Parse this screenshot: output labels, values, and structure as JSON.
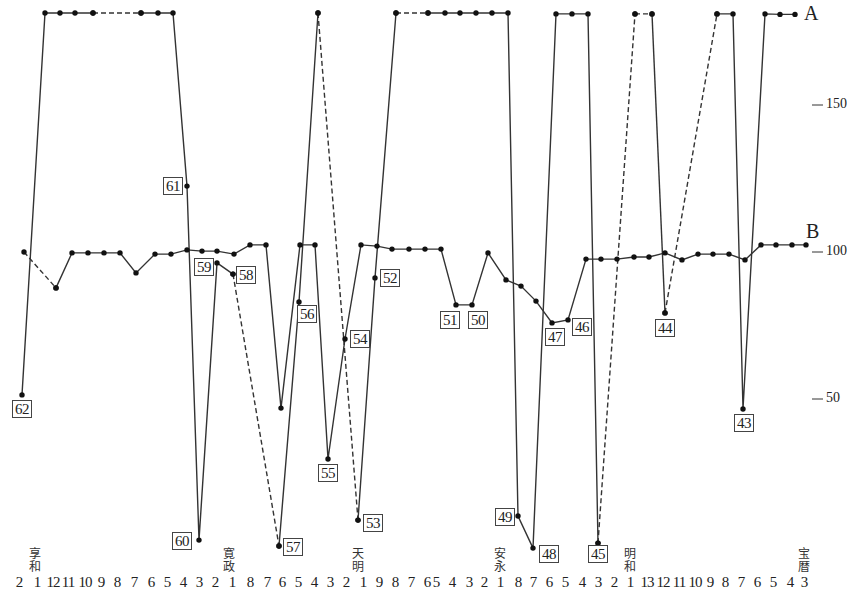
{
  "chart_data": {
    "type": "line",
    "title": "",
    "xlabel": "",
    "ylabel": "",
    "ylim": [
      0,
      185
    ],
    "y_ticks": [
      {
        "value": 150,
        "label": "150"
      },
      {
        "value": 100,
        "label": "100"
      },
      {
        "value": 50,
        "label": "50"
      }
    ],
    "grid": false,
    "legend": [
      {
        "name": "A",
        "position": "right-top"
      },
      {
        "name": "B",
        "position": "right-middle"
      }
    ],
    "x_ticks": [
      {
        "x": 19,
        "label": "2"
      },
      {
        "x": 37,
        "label": "1"
      },
      {
        "x": 53,
        "label": "12"
      },
      {
        "x": 68,
        "label": "11"
      },
      {
        "x": 85,
        "label": "10"
      },
      {
        "x": 101,
        "label": "9"
      },
      {
        "x": 117,
        "label": "8"
      },
      {
        "x": 134,
        "label": "7"
      },
      {
        "x": 151,
        "label": "6"
      },
      {
        "x": 167,
        "label": "5"
      },
      {
        "x": 183,
        "label": "4"
      },
      {
        "x": 199,
        "label": "3"
      },
      {
        "x": 215,
        "label": "2"
      },
      {
        "x": 232,
        "label": "1"
      },
      {
        "x": 250,
        "label": "8"
      },
      {
        "x": 267,
        "label": "7"
      },
      {
        "x": 282,
        "label": "6"
      },
      {
        "x": 298,
        "label": "5"
      },
      {
        "x": 314,
        "label": "4"
      },
      {
        "x": 330,
        "label": "3"
      },
      {
        "x": 346,
        "label": "2"
      },
      {
        "x": 363,
        "label": "1"
      },
      {
        "x": 379,
        "label": "9"
      },
      {
        "x": 395,
        "label": "8"
      },
      {
        "x": 411,
        "label": "7"
      },
      {
        "x": 427,
        "label": "6"
      },
      {
        "x": 436,
        "label": "5"
      },
      {
        "x": 452,
        "label": "4"
      },
      {
        "x": 469,
        "label": "3"
      },
      {
        "x": 484,
        "label": "2"
      },
      {
        "x": 500,
        "label": "1"
      },
      {
        "x": 518,
        "label": "8"
      },
      {
        "x": 533,
        "label": "7"
      },
      {
        "x": 549,
        "label": "6"
      },
      {
        "x": 565,
        "label": "5"
      },
      {
        "x": 582,
        "label": "4"
      },
      {
        "x": 598,
        "label": "3"
      },
      {
        "x": 614,
        "label": "2"
      },
      {
        "x": 630,
        "label": "1"
      },
      {
        "x": 647,
        "label": "13"
      },
      {
        "x": 663,
        "label": "12"
      },
      {
        "x": 679,
        "label": "11"
      },
      {
        "x": 695,
        "label": "10"
      },
      {
        "x": 710,
        "label": "9"
      },
      {
        "x": 725,
        "label": "8"
      },
      {
        "x": 741,
        "label": "7"
      },
      {
        "x": 757,
        "label": "6"
      },
      {
        "x": 773,
        "label": "5"
      },
      {
        "x": 790,
        "label": "4"
      },
      {
        "x": 804,
        "label": "3"
      }
    ],
    "eras": [
      {
        "x": 35,
        "label": "享和"
      },
      {
        "x": 229,
        "label": "寛政"
      },
      {
        "x": 358,
        "label": "天明"
      },
      {
        "x": 500,
        "label": "安永"
      },
      {
        "x": 630,
        "label": "明和"
      },
      {
        "x": 804,
        "label": "宝暦"
      }
    ],
    "series": [
      {
        "name": "A",
        "segments": [
          {
            "style": "solid",
            "points": [
              [
                22,
                51.4
              ],
              [
                45,
                181.3
              ],
              [
                60,
                181.3
              ],
              [
                75,
                181.3
              ],
              [
                93,
                181.3
              ]
            ]
          },
          {
            "style": "dashed",
            "points": [
              [
                93,
                181.3
              ],
              [
                141,
                181.3
              ]
            ]
          },
          {
            "style": "solid",
            "points": [
              [
                141,
                181.3
              ],
              [
                158,
                181.3
              ],
              [
                173,
                181.3
              ],
              [
                187,
                122.4
              ],
              [
                199,
                2.0
              ],
              [
                217,
                96.3
              ],
              [
                233,
                92.5
              ]
            ]
          },
          {
            "style": "dashed",
            "points": [
              [
                233,
                92.5
              ],
              [
                279,
                0.0
              ]
            ]
          },
          {
            "style": "solid",
            "points": [
              [
                279,
                0.0
              ],
              [
                299,
                83.0
              ],
              [
                318,
                181.3
              ]
            ]
          },
          {
            "style": "dashed",
            "points": [
              [
                318,
                181.3
              ],
              [
                358,
                8.8
              ]
            ]
          },
          {
            "style": "solid",
            "points": [
              [
                358,
                8.8
              ],
              [
                375,
                91.2
              ],
              [
                396,
                181.3
              ]
            ]
          },
          {
            "style": "dashed",
            "points": [
              [
                396,
                181.3
              ],
              [
                428,
                181.3
              ]
            ]
          },
          {
            "style": "solid",
            "points": [
              [
                428,
                181.3
              ],
              [
                445,
                181.3
              ],
              [
                460,
                181.3
              ],
              [
                476,
                181.3
              ],
              [
                492,
                181.3
              ],
              [
                508,
                181.3
              ],
              [
                518,
                10.2
              ],
              [
                533,
                -0.7
              ],
              [
                556,
                181.0
              ],
              [
                572,
                181.0
              ],
              [
                588,
                181.0
              ],
              [
                598,
                1.0
              ]
            ]
          },
          {
            "style": "dashed",
            "points": [
              [
                598,
                1.0
              ],
              [
                635,
                181.0
              ]
            ]
          },
          {
            "style": "dashed",
            "points": [
              [
                635,
                181.0
              ],
              [
                652,
                181.0
              ]
            ]
          },
          {
            "style": "solid",
            "points": [
              [
                652,
                181.0
              ],
              [
                665,
                79.3
              ]
            ]
          },
          {
            "style": "dashed",
            "points": [
              [
                665,
                79.3
              ],
              [
                717,
                181.0
              ]
            ]
          },
          {
            "style": "solid",
            "points": [
              [
                717,
                181.0
              ],
              [
                733,
                181.0
              ],
              [
                743,
                46.6
              ],
              [
                765,
                181.0
              ],
              [
                780,
                180.8
              ],
              [
                795,
                180.8
              ]
            ]
          }
        ]
      },
      {
        "name": "B",
        "segments": [
          {
            "style": "dashed",
            "points": [
              [
                24,
                100.0
              ],
              [
                56,
                87.8
              ]
            ]
          },
          {
            "style": "solid",
            "points": [
              [
                56,
                87.8
              ],
              [
                72,
                99.7
              ],
              [
                88,
                99.7
              ],
              [
                104,
                99.7
              ],
              [
                120,
                99.7
              ],
              [
                136,
                92.9
              ],
              [
                155,
                99.3
              ],
              [
                171,
                99.3
              ],
              [
                187,
                100.7
              ],
              [
                202,
                100.3
              ],
              [
                217,
                100.3
              ],
              [
                234,
                99.3
              ],
              [
                250,
                102.4
              ],
              [
                266,
                102.4
              ],
              [
                281,
                46.9
              ],
              [
                300,
                102.4
              ],
              [
                315,
                102.4
              ],
              [
                328,
                29.6
              ],
              [
                345,
                70.4
              ],
              [
                361,
                102.4
              ],
              [
                377,
                102.0
              ],
              [
                392,
                101.0
              ],
              [
                409,
                101.0
              ],
              [
                425,
                101.0
              ],
              [
                441,
                101.0
              ],
              [
                456,
                82.0
              ],
              [
                472,
                82.0
              ],
              [
                488,
                99.7
              ],
              [
                506,
                90.5
              ],
              [
                521,
                88.4
              ],
              [
                536,
                83.3
              ],
              [
                552,
                75.9
              ],
              [
                568,
                76.9
              ],
              [
                586,
                97.6
              ],
              [
                601,
                97.6
              ],
              [
                617,
                97.6
              ],
              [
                634,
                98.3
              ],
              [
                649,
                98.3
              ],
              [
                665,
                99.7
              ],
              [
                682,
                97.3
              ],
              [
                698,
                99.3
              ],
              [
                713,
                99.3
              ],
              [
                729,
                99.3
              ],
              [
                745,
                97.3
              ],
              [
                761,
                102.4
              ],
              [
                776,
                102.4
              ],
              [
                792,
                102.4
              ],
              [
                806,
                102.4
              ]
            ]
          }
        ]
      }
    ],
    "annotations": [
      {
        "label": "62",
        "px": 22,
        "value": 51.4,
        "box": [
          12,
          400
        ]
      },
      {
        "label": "61",
        "px": 187,
        "value": 122.4,
        "box": [
          163,
          177
        ]
      },
      {
        "label": "60",
        "px": 199,
        "value": 2.0,
        "box": [
          172,
          532
        ]
      },
      {
        "label": "59",
        "px": 217,
        "value": 96.3,
        "box": [
          194,
          258
        ]
      },
      {
        "label": "58",
        "px": 233,
        "value": 92.5,
        "box": [
          236,
          266
        ]
      },
      {
        "label": "57",
        "px": 279,
        "value": 0.0,
        "box": [
          283,
          538
        ]
      },
      {
        "label": "56",
        "px": 299,
        "value": 83.0,
        "box": [
          297,
          305
        ]
      },
      {
        "label": "55",
        "px": 328,
        "value": 29.6,
        "box": [
          318,
          464
        ]
      },
      {
        "label": "54",
        "px": 345,
        "value": 70.4,
        "box": [
          350,
          330
        ]
      },
      {
        "label": "53",
        "px": 358,
        "value": 8.8,
        "box": [
          363,
          514
        ]
      },
      {
        "label": "52",
        "px": 375,
        "value": 91.2,
        "box": [
          380,
          269
        ]
      },
      {
        "label": "51",
        "px": 456,
        "value": 82.0,
        "box": [
          440,
          311
        ]
      },
      {
        "label": "50",
        "px": 472,
        "value": 82.0,
        "box": [
          468,
          311
        ]
      },
      {
        "label": "49",
        "px": 518,
        "value": 10.2,
        "box": [
          495,
          508
        ]
      },
      {
        "label": "48",
        "px": 533,
        "value": -0.7,
        "box": [
          539,
          545
        ]
      },
      {
        "label": "47",
        "px": 552,
        "value": 75.9,
        "box": [
          545,
          328
        ]
      },
      {
        "label": "46",
        "px": 568,
        "value": 76.9,
        "box": [
          572,
          318
        ]
      },
      {
        "label": "45",
        "px": 598,
        "value": 1.0,
        "box": [
          588,
          545
        ]
      },
      {
        "label": "44",
        "px": 665,
        "value": 79.3,
        "box": [
          655,
          319
        ]
      },
      {
        "label": "43",
        "px": 743,
        "value": 46.6,
        "box": [
          734,
          414
        ]
      }
    ]
  },
  "layout": {
    "y_px_at_100": 252,
    "px_per_unit": 2.94,
    "line_color": "#333333",
    "tick_x": 812
  }
}
